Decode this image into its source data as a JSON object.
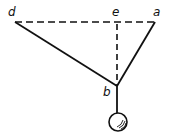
{
  "diagram": {
    "type": "pendulum-string-geometry",
    "points": {
      "d": {
        "label": "d",
        "x": 15,
        "y": 22
      },
      "e": {
        "label": "e",
        "x": 117,
        "y": 22
      },
      "a": {
        "label": "a",
        "x": 155,
        "y": 22
      },
      "b": {
        "label": "b",
        "x": 117,
        "y": 85
      }
    },
    "segments": [
      {
        "from": "d",
        "to": "a",
        "style": "dashed"
      },
      {
        "from": "e",
        "to": "b",
        "style": "dashed"
      },
      {
        "from": "d",
        "to": "b",
        "style": "solid"
      },
      {
        "from": "a",
        "to": "b",
        "style": "solid"
      },
      {
        "from": "b",
        "to": "ball",
        "style": "solid"
      }
    ],
    "ball": {
      "cx": 118,
      "cy": 122,
      "r": 9
    },
    "colors": {
      "line": "#111111",
      "background": "#ffffff"
    }
  }
}
